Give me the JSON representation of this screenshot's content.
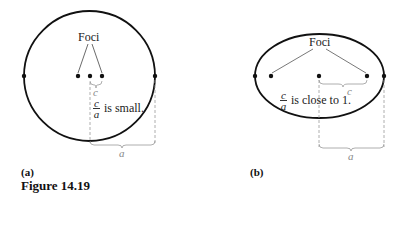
{
  "figure": {
    "caption": "Figure 14.19",
    "panels": [
      {
        "id": "a",
        "label": "(a)",
        "shape": "circle",
        "foci_label": "Foci",
        "ratio_num": "c",
        "ratio_den": "a",
        "ratio_text": "is small.",
        "c_label": "c",
        "a_label": "a"
      },
      {
        "id": "b",
        "label": "(b)",
        "shape": "ellipse",
        "foci_label": "Foci",
        "ratio_num": "c",
        "ratio_den": "a",
        "ratio_text": "is close to 1.",
        "c_label": "c",
        "a_label": "a"
      }
    ],
    "colors": {
      "curve": "#111111",
      "leader": "#555555",
      "dimension": "#999999"
    }
  }
}
